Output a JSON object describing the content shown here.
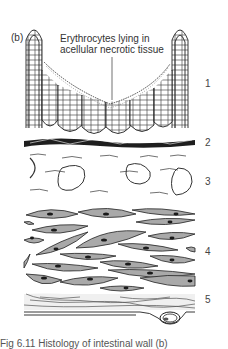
{
  "figure": {
    "panel_label": "(b)",
    "annotation": {
      "line1": "Erythrocytes lying in",
      "line2": "acellular necrotic tissue"
    },
    "layers": [
      {
        "number": "1",
        "top": 78
      },
      {
        "number": "2",
        "top": 137
      },
      {
        "number": "3",
        "top": 176
      },
      {
        "number": "4",
        "top": 246
      },
      {
        "number": "5",
        "top": 294
      }
    ],
    "caption": "Fig 6.11 Histology of intestinal wall (b)",
    "colors": {
      "ink": "#222222",
      "muscle_fill": "#a9a9a9",
      "nucleus": "#1a1a1a",
      "connective_fill": "#eeeeee",
      "background": "#ffffff"
    }
  }
}
